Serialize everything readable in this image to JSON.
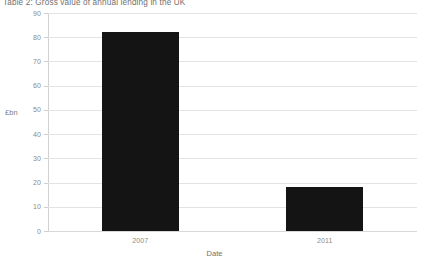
{
  "chart_data": {
    "type": "bar",
    "title": "Table 2: Gross value of annual lending in the UK",
    "xlabel": "Date",
    "ylabel": "£bn",
    "categories": [
      "2007",
      "2011"
    ],
    "values": [
      82,
      18
    ],
    "series": [
      {
        "name": "Gross value of annual lending",
        "values": [
          82,
          18
        ]
      }
    ],
    "ylim": [
      0,
      90
    ],
    "yticks": [
      0,
      10,
      20,
      30,
      40,
      50,
      60,
      70,
      80,
      90
    ],
    "ytick_labels": [
      "0",
      "10",
      "20",
      "30",
      "40",
      "50",
      "60",
      "70",
      "80",
      "90"
    ],
    "grid": true,
    "legend": false,
    "bar_color": "#141414",
    "grid_color": "#e3e3e3",
    "background_color": "#ffffff",
    "text_color": "#8a8a8a"
  }
}
